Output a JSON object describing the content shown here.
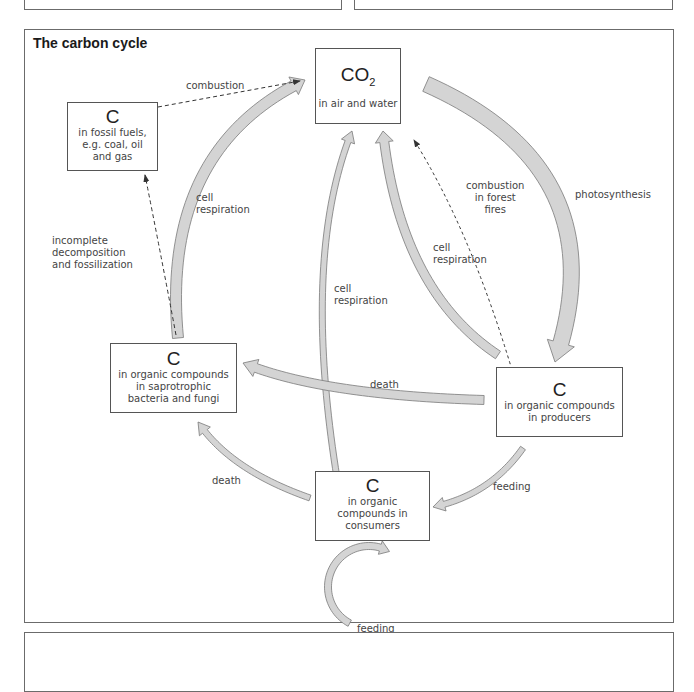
{
  "diagram": {
    "title": "The carbon cycle",
    "nodes": {
      "co2": {
        "symbol": "CO",
        "subscript": "2",
        "description": "in air and water"
      },
      "fossil": {
        "symbol": "C",
        "description": "in fossil fuels,\ne.g. coal, oil\nand gas"
      },
      "decomposers": {
        "symbol": "C",
        "description": "in organic compounds\nin saprotrophic\nbacteria and fungi"
      },
      "producers": {
        "symbol": "C",
        "description": "in organic compounds\nin producers"
      },
      "consumers": {
        "symbol": "C",
        "description": "in organic\ncompounds in\nconsumers"
      }
    },
    "edges": [
      {
        "from": "fossil",
        "to": "co2",
        "label": "combustion",
        "style": "dashed"
      },
      {
        "from": "decomposers",
        "to": "co2",
        "label": "cell\nrespiration",
        "style": "solid"
      },
      {
        "from": "decomposers",
        "to": "fossil",
        "label": "incomplete\ndecomposition\nand fossilization",
        "style": "dashed"
      },
      {
        "from": "consumers",
        "to": "co2",
        "label": "cell\nrespiration",
        "style": "solid"
      },
      {
        "from": "producers",
        "to": "co2",
        "label": "cell\nrespiration",
        "style": "solid"
      },
      {
        "from": "producers",
        "to": "co2",
        "label": "combustion\nin forest\nfires",
        "style": "dashed"
      },
      {
        "from": "co2",
        "to": "producers",
        "label": "photosynthesis",
        "style": "solid"
      },
      {
        "from": "producers",
        "to": "decomposers",
        "label": "death",
        "style": "solid"
      },
      {
        "from": "producers",
        "to": "consumers",
        "label": "feeding",
        "style": "solid"
      },
      {
        "from": "consumers",
        "to": "decomposers",
        "label": "death",
        "style": "solid"
      },
      {
        "from": "consumers",
        "to": "consumers",
        "label": "feeding",
        "style": "solid"
      }
    ]
  },
  "colors": {
    "arrow_fill": "#d4d4d4",
    "arrow_stroke": "#7a7a7a",
    "border": "#555555",
    "text": "#444444"
  }
}
